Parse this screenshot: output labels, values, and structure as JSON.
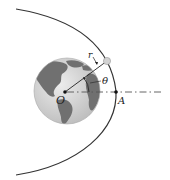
{
  "diagram": {
    "labels": {
      "origin": "O",
      "point_a": "A",
      "radius": "r",
      "angle": "θ"
    },
    "colors": {
      "orbit": "#333333",
      "earth_ocean": "#d4d4d4",
      "earth_land": "#6e6e6e",
      "axis": "#555555",
      "satellite": "#cfcfcf"
    }
  }
}
